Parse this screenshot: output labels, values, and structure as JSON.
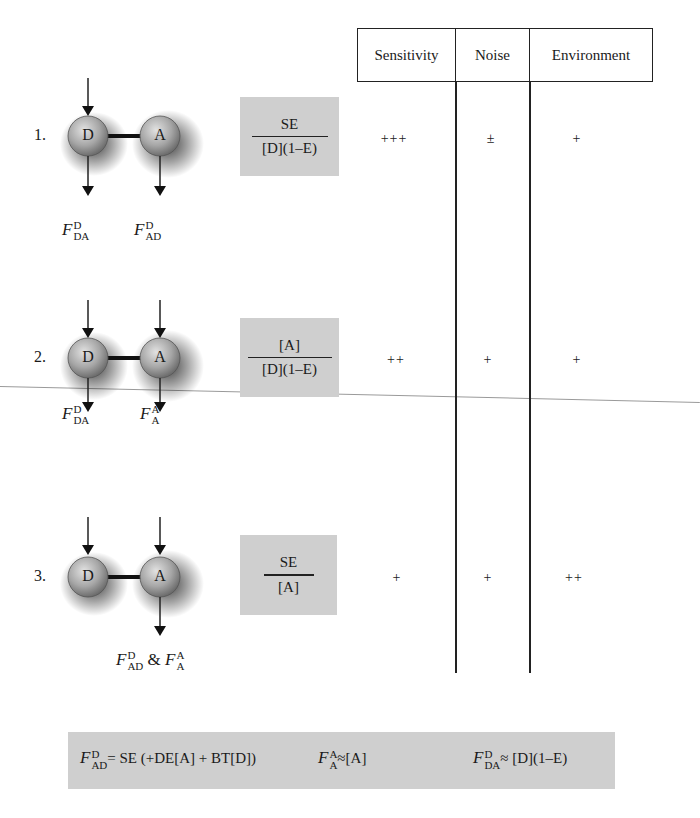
{
  "table": {
    "headers": [
      "Sensitivity",
      "Noise",
      "Environment"
    ]
  },
  "rows": [
    {
      "number": "1.",
      "ratio": {
        "numerator": "SE",
        "denominator": "[D](1–E)"
      },
      "sensitivity": "+++",
      "noise": "±",
      "environment": "+",
      "labels": [
        {
          "base": "F",
          "sup": "D",
          "sub": "DA"
        },
        {
          "base": "F",
          "sup": "D",
          "sub": "AD"
        }
      ]
    },
    {
      "number": "2.",
      "ratio": {
        "numerator": "[A]",
        "denominator": "[D](1–E)"
      },
      "sensitivity": "++",
      "noise": "+",
      "environment": "+",
      "labels": [
        {
          "base": "F",
          "sup": "D",
          "sub": "DA"
        },
        {
          "base": "F",
          "sup": "A",
          "sub": "A"
        }
      ]
    },
    {
      "number": "3.",
      "ratio": {
        "numerator": "SE",
        "denominator": "[A]"
      },
      "sensitivity": "+",
      "noise": "+",
      "environment": "++",
      "labels": [
        {
          "base": "F",
          "sup": "D",
          "sub": "AD"
        },
        {
          "connector": "&"
        },
        {
          "base": "F",
          "sup": "A",
          "sub": "A"
        }
      ]
    }
  ],
  "nodes": {
    "donor": "D",
    "acceptor": "A"
  },
  "footer_formula": {
    "part1": {
      "base": "F",
      "sup": "D",
      "sub": "AD",
      "rest": "= SE (+DE[A] + BT[D])"
    },
    "part2": {
      "base": "F",
      "sup": "A",
      "sub": "A",
      "rest": "≈[A]"
    },
    "part3": {
      "base": "F",
      "sup": "D",
      "sub": "DA",
      "rest": "≈ [D](1–E)"
    }
  },
  "colors": {
    "box_fill": "#cfcfcf",
    "line": "#222222",
    "node_fill": "#a8a8a8"
  }
}
